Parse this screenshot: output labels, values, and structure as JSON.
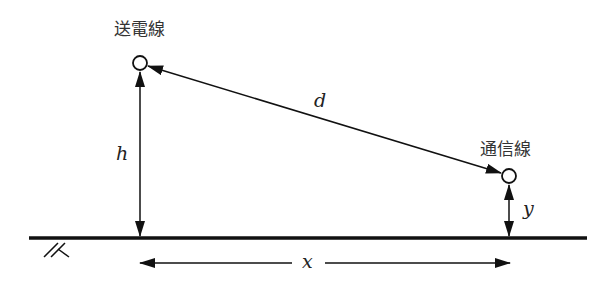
{
  "diagram": {
    "labels": {
      "power_line": "送電線",
      "comm_line": "通信線",
      "distance": "d",
      "height_power": "h",
      "height_comm": "y",
      "horizontal": "x"
    },
    "colors": {
      "line": "#111111",
      "text": "#333333",
      "background": "#ffffff"
    },
    "geometry": {
      "power_line_point": [
        140,
        63
      ],
      "comm_line_point": [
        509,
        176
      ],
      "ground_y": 238,
      "ground_x_range": [
        29,
        587
      ],
      "horizontal_arrow_y": 263
    }
  }
}
